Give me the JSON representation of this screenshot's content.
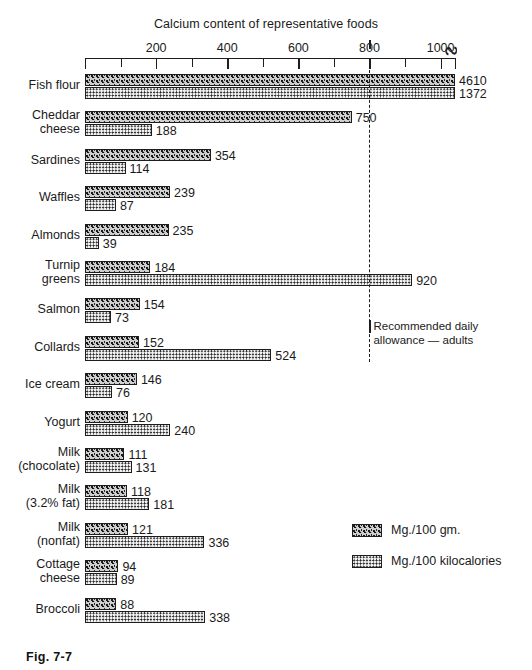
{
  "figure": {
    "caption": "Fig. 7-7",
    "title": "Calcium content of representative foods"
  },
  "legend": {
    "items": [
      {
        "key": "gm",
        "label": "Mg./100 gm.",
        "swatch": "coarse-speckle-swatch"
      },
      {
        "key": "kcal",
        "label": "Mg./100 kilocalories",
        "swatch": "fine-dot-swatch"
      }
    ]
  },
  "annotation": {
    "rda_text": "Recommended daily\n allowance — adults",
    "rda_value": 800
  },
  "chart_data": {
    "type": "bar",
    "title": "Calcium content of representative foods",
    "xlabel": "",
    "ylabel": "",
    "orientation": "horizontal",
    "grid": false,
    "legend_position": "bottom-right",
    "xlim": [
      0,
      1040
    ],
    "axis_break_after": 1000,
    "xticks": [
      0,
      100,
      200,
      300,
      400,
      500,
      600,
      700,
      800,
      900,
      1000
    ],
    "xtick_labels": [
      "",
      "",
      "200",
      "",
      "400",
      "",
      "600",
      "",
      "800",
      "",
      "1000"
    ],
    "categories": [
      "Fish flour",
      "Cheddar\ncheese",
      "Sardines",
      "Waffles",
      "Almonds",
      "Turnip\ngreens",
      "Salmon",
      "Collards",
      "Ice cream",
      "Yogurt",
      "Milk\n(chocolate)",
      "Milk\n(3.2% fat)",
      "Milk\n(nonfat)",
      "Cottage\ncheese",
      "Broccoli"
    ],
    "series": [
      {
        "name": "Mg./100 gm.",
        "values": [
          4610,
          750,
          354,
          239,
          235,
          184,
          154,
          152,
          146,
          120,
          111,
          118,
          121,
          94,
          88
        ]
      },
      {
        "name": "Mg./100 kilocalories",
        "values": [
          1372,
          188,
          114,
          87,
          39,
          920,
          73,
          524,
          76,
          240,
          131,
          181,
          336,
          89,
          338
        ]
      }
    ],
    "annotations": [
      {
        "label": "Recommended daily allowance — adults",
        "x": 800,
        "style": "dashed-vertical-line"
      }
    ]
  }
}
